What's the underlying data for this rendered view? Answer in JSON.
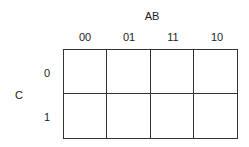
{
  "kmap": {
    "col_variable": "AB",
    "row_variable": "C",
    "col_headers": [
      "00",
      "01",
      "11",
      "10"
    ],
    "row_headers": [
      "0",
      "1"
    ],
    "cells": [
      [
        "",
        "",
        "",
        ""
      ],
      [
        "",
        "",
        "",
        ""
      ]
    ]
  }
}
